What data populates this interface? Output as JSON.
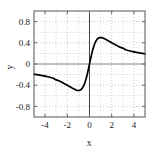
{
  "chart_data": {
    "type": "line",
    "title": "",
    "xlabel": "x",
    "ylabel": "y",
    "xlim": [
      -5,
      5
    ],
    "ylim": [
      -1.0,
      1.0
    ],
    "xticks": [
      -4,
      -2,
      0,
      2,
      4
    ],
    "xticklabels": [
      "-4",
      "-2",
      "0",
      "2",
      "4"
    ],
    "yticks": [
      -0.8,
      -0.4,
      0,
      0.4,
      0.8
    ],
    "yticklabels": [
      "-0.8",
      "-0.4",
      "0",
      "0.4",
      "0.8"
    ],
    "grid": true,
    "grid_style": "dotted",
    "legend": null,
    "line_color": "#000000",
    "line_width": 1.6,
    "frame_color": "#555555",
    "zero_axis_color": "#444444",
    "series": [
      {
        "name": "y(x)",
        "x": [
          -5.0,
          -4.75,
          -4.5,
          -4.25,
          -4.0,
          -3.75,
          -3.5,
          -3.25,
          -3.0,
          -2.75,
          -2.5,
          -2.25,
          -2.0,
          -1.8,
          -1.6,
          -1.4,
          -1.2,
          -1.1,
          -1.0,
          -0.9,
          -0.8,
          -0.7,
          -0.6,
          -0.5,
          -0.4,
          -0.3,
          -0.2,
          -0.1,
          0.0,
          0.1,
          0.2,
          0.3,
          0.4,
          0.5,
          0.6,
          0.7,
          0.8,
          0.9,
          1.0,
          1.1,
          1.2,
          1.4,
          1.6,
          1.8,
          2.0,
          2.25,
          2.5,
          2.75,
          3.0,
          3.25,
          3.5,
          3.75,
          4.0,
          4.25,
          4.5,
          4.75,
          5.0
        ],
        "y": [
          -0.192,
          -0.2,
          -0.209,
          -0.218,
          -0.229,
          -0.241,
          -0.254,
          -0.269,
          -0.3,
          -0.318,
          -0.345,
          -0.374,
          -0.4,
          -0.424,
          -0.449,
          -0.47,
          -0.492,
          -0.498,
          -0.5,
          -0.497,
          -0.488,
          -0.47,
          -0.441,
          -0.4,
          -0.345,
          -0.275,
          -0.192,
          -0.099,
          0.0,
          0.099,
          0.192,
          0.275,
          0.345,
          0.4,
          0.441,
          0.47,
          0.488,
          0.497,
          0.5,
          0.498,
          0.492,
          0.47,
          0.449,
          0.424,
          0.4,
          0.374,
          0.345,
          0.318,
          0.3,
          0.269,
          0.254,
          0.241,
          0.229,
          0.218,
          0.209,
          0.2,
          0.192
        ]
      }
    ],
    "peak": {
      "x": 1.0,
      "y": 0.5
    },
    "trough": {
      "x": -1.0,
      "y": -0.5
    }
  },
  "labels": {
    "xaxis_title": "x",
    "yaxis_title": "y",
    "xticks": [
      "-4",
      "-2",
      "0",
      "2",
      "4"
    ],
    "yticks": [
      "0.8",
      "0.4",
      "0",
      "-0.4",
      "-0.8"
    ]
  }
}
